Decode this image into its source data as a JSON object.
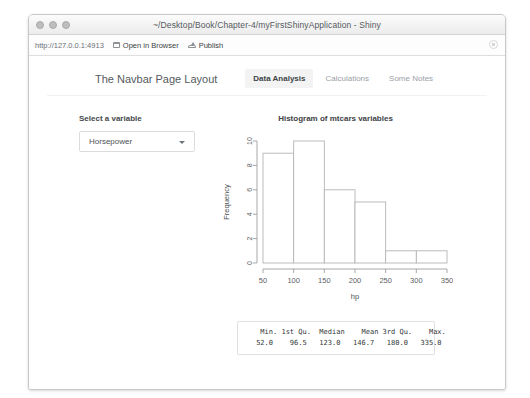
{
  "window": {
    "title": "~/Desktop/Book/Chapter-4/myFirstShinyApplication - Shiny",
    "traffic_lights": [
      "close-dot",
      "minimize-dot",
      "maximize-dot"
    ]
  },
  "toolbar": {
    "address": "http://127.0.0.1:4913",
    "open_in_browser_label": "Open in Browser",
    "publish_label": "Publish",
    "stop_icon": "stop-circle-icon"
  },
  "navbar": {
    "brand": "The Navbar Page Layout",
    "tabs": [
      {
        "label": "Data Analysis",
        "active": true
      },
      {
        "label": "Calculations",
        "active": false
      },
      {
        "label": "Some Notes",
        "active": false
      }
    ]
  },
  "sidebar": {
    "label": "Select a variable",
    "select": {
      "value": "Horsepower",
      "caret_icon": "chevron-down-icon"
    }
  },
  "main": {
    "plot_title": "Histogram of mtcars variables",
    "summary_header": "    Min. 1st Qu.  Median    Mean 3rd Qu.    Max. ",
    "summary_values": "   52.0    96.5   123.0   146.7   180.0   335.0 "
  },
  "chart_data": {
    "type": "bar",
    "title": "Histogram of mtcars variables",
    "xlabel": "hp",
    "ylabel": "Frequency",
    "bin_edges": [
      50,
      100,
      150,
      200,
      250,
      300,
      350
    ],
    "categories": [
      "50-100",
      "100-150",
      "150-200",
      "200-250",
      "250-300",
      "300-350"
    ],
    "values": [
      9,
      10,
      6,
      5,
      1,
      1
    ],
    "xlim": [
      50,
      350
    ],
    "ylim": [
      0,
      10
    ],
    "xticks": [
      50,
      100,
      150,
      200,
      250,
      300,
      350
    ],
    "yticks": [
      0,
      2,
      4,
      6,
      8,
      10
    ],
    "grid": false,
    "legend": "none",
    "bar_fill": "#ffffff",
    "bar_stroke": "#b4b4b4"
  }
}
